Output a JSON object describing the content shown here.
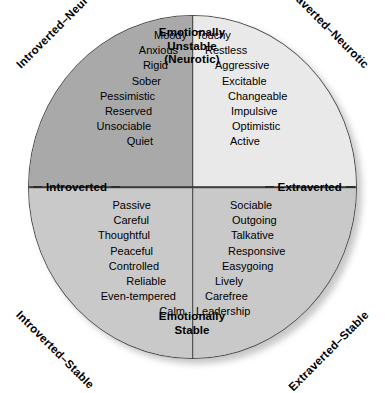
{
  "diagram": {
    "type": "circumplex",
    "poles": {
      "top": [
        "Emotionally",
        "Unstable",
        "(Neurotic)"
      ],
      "bottom": [
        "Emotionally",
        "Stable"
      ],
      "left": "Introverted",
      "right": "Extraverted"
    },
    "corners": {
      "top_left": "Introverted–Neurotic",
      "top_right": "Extraverted–Neurotic",
      "bottom_left": "Introverted–Stable",
      "bottom_right": "Extraverted–Stable"
    },
    "quadrants": {
      "top_left": {
        "name": "Introverted–Neurotic",
        "fill": "#a9a9a9",
        "traits": [
          "Moody",
          "Anxious",
          "Rigid",
          "Sober",
          "Pessimistic",
          "Reserved",
          "Unsociable",
          "Quiet"
        ]
      },
      "top_right": {
        "name": "Extraverted–Neurotic",
        "fill": "#e9e9e9",
        "traits": [
          "Touchy",
          "Restless",
          "Aggressive",
          "Excitable",
          "Changeable",
          "Impulsive",
          "Optimistic",
          "Active"
        ]
      },
      "bottom_left": {
        "name": "Introverted–Stable",
        "fill": "#c9c9c9",
        "traits": [
          "Passive",
          "Careful",
          "Thoughtful",
          "Peaceful",
          "Controlled",
          "Reliable",
          "Even-tempered",
          "Calm"
        ]
      },
      "bottom_right": {
        "name": "Extraverted–Stable",
        "fill": "#c9c9c9",
        "traits": [
          "Sociable",
          "Outgoing",
          "Talkative",
          "Responsive",
          "Easygoing",
          "Lively",
          "Carefree",
          "Leadership"
        ]
      }
    },
    "colors": {
      "outline": "#4a4a4a",
      "axis": "#3a3a3a",
      "text": "#000000",
      "background": "#ffffff"
    }
  }
}
